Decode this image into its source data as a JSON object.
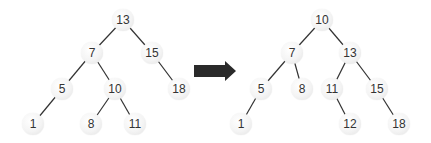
{
  "diagram": {
    "type": "binary-search-tree-transformation",
    "edge_color": "#333333",
    "node_fill": "#f2f2f2",
    "arrow_color": "#2a2a2a",
    "trees": [
      {
        "id": "before",
        "nodes": [
          {
            "id": "b13",
            "label": "13",
            "x": 123,
            "y": 20
          },
          {
            "id": "b7",
            "label": "7",
            "x": 92,
            "y": 53
          },
          {
            "id": "b15",
            "label": "15",
            "x": 152,
            "y": 53
          },
          {
            "id": "b5",
            "label": "5",
            "x": 62,
            "y": 89
          },
          {
            "id": "b10",
            "label": "10",
            "x": 115,
            "y": 89
          },
          {
            "id": "b18",
            "label": "18",
            "x": 179,
            "y": 89
          },
          {
            "id": "b1",
            "label": "1",
            "x": 33,
            "y": 124
          },
          {
            "id": "b8",
            "label": "8",
            "x": 91,
            "y": 124
          },
          {
            "id": "b11",
            "label": "11",
            "x": 135,
            "y": 124
          }
        ],
        "edges": [
          [
            "b13",
            "b7"
          ],
          [
            "b13",
            "b15"
          ],
          [
            "b7",
            "b5"
          ],
          [
            "b7",
            "b10"
          ],
          [
            "b15",
            "b18"
          ],
          [
            "b5",
            "b1"
          ],
          [
            "b10",
            "b8"
          ],
          [
            "b10",
            "b11"
          ]
        ]
      },
      {
        "id": "after",
        "nodes": [
          {
            "id": "a10",
            "label": "10",
            "x": 322,
            "y": 20
          },
          {
            "id": "a7",
            "label": "7",
            "x": 292,
            "y": 53
          },
          {
            "id": "a13",
            "label": "13",
            "x": 350,
            "y": 53
          },
          {
            "id": "a5",
            "label": "5",
            "x": 261,
            "y": 89
          },
          {
            "id": "a8",
            "label": "8",
            "x": 302,
            "y": 89
          },
          {
            "id": "a11",
            "label": "11",
            "x": 332,
            "y": 89
          },
          {
            "id": "a15",
            "label": "15",
            "x": 377,
            "y": 89
          },
          {
            "id": "a1",
            "label": "1",
            "x": 241,
            "y": 124
          },
          {
            "id": "a12",
            "label": "12",
            "x": 350,
            "y": 124
          },
          {
            "id": "a18",
            "label": "18",
            "x": 399,
            "y": 124
          }
        ],
        "edges": [
          [
            "a10",
            "a7"
          ],
          [
            "a10",
            "a13"
          ],
          [
            "a7",
            "a5"
          ],
          [
            "a7",
            "a8"
          ],
          [
            "a13",
            "a11"
          ],
          [
            "a13",
            "a15"
          ],
          [
            "a5",
            "a1"
          ],
          [
            "a11",
            "a12"
          ],
          [
            "a15",
            "a18"
          ]
        ]
      }
    ],
    "arrow": {
      "x1": 194,
      "x2": 236,
      "y": 71,
      "icon": "right-arrow-icon"
    }
  }
}
